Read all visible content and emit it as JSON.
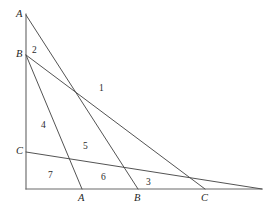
{
  "figure": {
    "type": "geometry-diagram",
    "background_color": "#ffffff",
    "axis_color": "#6b6b6b",
    "segment_color": "#4a4a4a",
    "label_color": "#1f1f1f"
  },
  "axes": {
    "vertical": {
      "name": "vertical-axis",
      "x": 26,
      "y_top": 14,
      "y_bottom": 189
    },
    "horizontal": {
      "name": "horizontal-axis",
      "y": 189,
      "x_left": 26,
      "x_right": 262
    }
  },
  "points": {
    "vertical_axis": [
      {
        "id": "A-top",
        "label": "A",
        "x": 26,
        "y": 15,
        "label_x": 16,
        "label_y": 9
      },
      {
        "id": "B-top",
        "label": "B",
        "x": 26,
        "y": 55,
        "label_x": 16,
        "label_y": 49
      },
      {
        "id": "C-left",
        "label": "C",
        "x": 26,
        "y": 152,
        "label_x": 16,
        "label_y": 146
      }
    ],
    "horizontal_axis": [
      {
        "id": "A-bottom",
        "label": "A",
        "x": 82,
        "y": 189,
        "label_x": 78,
        "label_y": 193
      },
      {
        "id": "B-bottom",
        "label": "B",
        "x": 138,
        "y": 189,
        "label_x": 134,
        "label_y": 193
      },
      {
        "id": "C-right",
        "label": "C",
        "x": 205,
        "y": 189,
        "label_x": 201,
        "label_y": 193
      }
    ]
  },
  "segments": [
    {
      "id": "line-A",
      "from": "A-top",
      "to": "B-bottom",
      "x1": 26,
      "y1": 15,
      "x2": 138,
      "y2": 189
    },
    {
      "id": "line-B",
      "from": "B-top",
      "to": "C-right",
      "x1": 26,
      "y1": 55,
      "x2": 205,
      "y2": 189
    },
    {
      "id": "line-C",
      "from": "C-left",
      "to": "A-bottom",
      "x1": 26,
      "y1": 152,
      "x2": 82,
      "y2": 189
    }
  ],
  "extra_segments": [
    {
      "id": "line-B-extended-left",
      "x1": 26,
      "y1": 55,
      "x2": 82,
      "y2": 189
    },
    {
      "id": "line-C-extended-right",
      "x1": 26,
      "y1": 152,
      "x2": 262,
      "y2": 189
    }
  ],
  "regions": [
    {
      "id": "region-1",
      "label": "1",
      "x": 99,
      "y": 84
    },
    {
      "id": "region-2",
      "label": "2",
      "x": 32,
      "y": 46
    },
    {
      "id": "region-3",
      "label": "3",
      "x": 146,
      "y": 178
    },
    {
      "id": "region-4",
      "label": "4",
      "x": 41,
      "y": 121
    },
    {
      "id": "region-5",
      "label": "5",
      "x": 83,
      "y": 142
    },
    {
      "id": "region-6",
      "label": "6",
      "x": 101,
      "y": 173
    },
    {
      "id": "region-7",
      "label": "7",
      "x": 48,
      "y": 171
    }
  ]
}
